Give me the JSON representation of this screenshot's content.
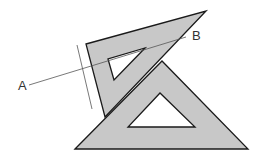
{
  "diagram": {
    "labels": {
      "point_a": "A",
      "point_b": "B"
    },
    "colors": {
      "fill": "#c8c8c8",
      "stroke": "#1a1a1a",
      "line": "#555555",
      "background": "#ffffff"
    },
    "shapes": [
      {
        "name": "back-set-square",
        "kind": "right-triangle with triangular cutout",
        "rotated": true
      },
      {
        "name": "front-set-square",
        "kind": "isosceles triangle with triangular cutout"
      }
    ],
    "lines": [
      {
        "name": "line-a-b",
        "from": "A",
        "to": "B"
      },
      {
        "name": "perpendicular-mark",
        "description": "short line crossing A-B near back set square edge"
      }
    ]
  }
}
